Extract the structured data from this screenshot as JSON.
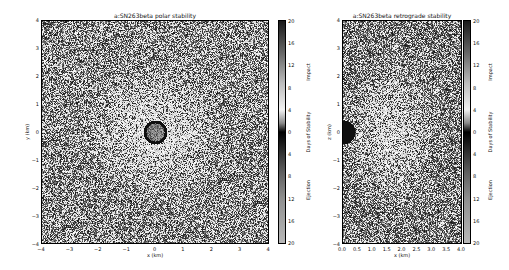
{
  "chart_data": [
    {
      "type": "heatmap",
      "title": "a:SN263beta polar stability",
      "xlabel": "x (km)",
      "ylabel": "y (km)",
      "xlim": [
        -4,
        4
      ],
      "ylim": [
        -4,
        4
      ],
      "xticks": [
        "−4",
        "−3",
        "−2",
        "−1",
        "0",
        "1",
        "2",
        "3",
        "4"
      ],
      "yticks": [
        "4",
        "3",
        "2",
        "1",
        "0",
        "−1",
        "−2",
        "−3",
        "−4"
      ],
      "colorbar": {
        "label": "Days of Stability",
        "top_label": "Impact",
        "bottom_label": "Ejection",
        "ticks": [
          "20",
          "16",
          "12",
          "8",
          "4",
          "0",
          "4",
          "8",
          "12",
          "16",
          "20"
        ]
      },
      "features": "Noisy grayscale stability map; lighter (more stable) region centered near origin; black ring of radius ~0.3 km at origin (central body)"
    },
    {
      "type": "heatmap",
      "title": "a:SN263beta retrograde stability",
      "xlabel": "x (km)",
      "ylabel": "z (km)",
      "xlim": [
        0.0,
        4.0
      ],
      "ylim": [
        -4,
        4
      ],
      "xticks": [
        "0.0",
        "0.5",
        "1.0",
        "1.5",
        "2.0",
        "2.5",
        "3.0",
        "3.5",
        "4.0"
      ],
      "yticks": [
        "4",
        "3",
        "2",
        "1",
        "0",
        "−1",
        "−2",
        "−3",
        "−4"
      ],
      "colorbar": {
        "label": "Days of Stability",
        "top_label": "Impact",
        "bottom_label": "Ejection",
        "ticks": [
          "20",
          "16",
          "12",
          "8",
          "4",
          "0",
          "4",
          "8",
          "12",
          "16",
          "20"
        ]
      },
      "features": "Noisy grayscale stability map; lighter region spanning roughly x 0.5–3 km, |z| < 3 km; black half-disk at x=0, z=0 (central body)"
    }
  ]
}
